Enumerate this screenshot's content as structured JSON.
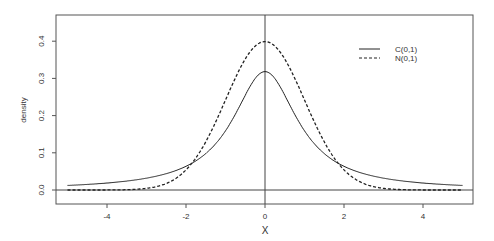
{
  "chart_data": {
    "type": "line",
    "title": "",
    "xlabel": "X",
    "ylabel": "density",
    "xlim": [
      -5.2,
      5.2
    ],
    "ylim": [
      -0.04,
      0.44
    ],
    "x_ticks": [
      -4,
      -2,
      0,
      2,
      4
    ],
    "x_tick_labels": [
      "-4",
      "-2",
      "0",
      "2",
      "4"
    ],
    "y_ticks": [
      0.0,
      0.1,
      0.2,
      0.3,
      0.4
    ],
    "y_tick_labels": [
      "0.0",
      "0.1",
      "0.2",
      "0.3",
      "0.4"
    ],
    "grid": false,
    "reference_lines": {
      "horizontal_y": 0,
      "vertical_x": 0
    },
    "legend": {
      "position": "top-right",
      "entries": [
        {
          "label": "C(0,1)",
          "style": "solid"
        },
        {
          "label": "N(0,1)",
          "style": "dashed"
        }
      ]
    },
    "series": [
      {
        "name": "C(0,1)",
        "style": "solid",
        "distribution": "cauchy",
        "location": 0,
        "scale": 1,
        "x": [
          -5,
          -4,
          -3,
          -2,
          -1,
          0,
          1,
          2,
          3,
          4,
          5
        ],
        "values": [
          0.012,
          0.019,
          0.032,
          0.064,
          0.159,
          0.318,
          0.159,
          0.064,
          0.032,
          0.019,
          0.012
        ]
      },
      {
        "name": "N(0,1)",
        "style": "dashed",
        "distribution": "normal",
        "mean": 0,
        "sd": 1,
        "x": [
          -5,
          -4,
          -3,
          -2,
          -1,
          0,
          1,
          2,
          3,
          4,
          5
        ],
        "values": [
          0.0,
          0.0001,
          0.004,
          0.054,
          0.242,
          0.399,
          0.242,
          0.054,
          0.004,
          0.0001,
          0.0
        ]
      }
    ]
  }
}
